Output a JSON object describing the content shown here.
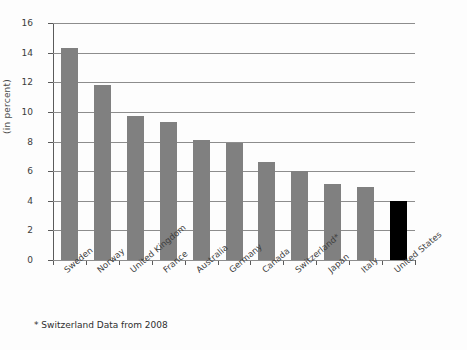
{
  "chart_data": {
    "type": "bar",
    "title": "",
    "xlabel": "",
    "ylabel": "(in percent)",
    "ylim": [
      0,
      16
    ],
    "ytick_step": 2,
    "yticks": [
      "16",
      "14",
      "12",
      "10",
      "8",
      "6",
      "4",
      "2",
      "0"
    ],
    "grid": true,
    "legend": null,
    "categories": [
      "Sweden",
      "Norway",
      "United Kingdom",
      "France",
      "Australia",
      "Germany",
      "Canada",
      "Switzerland*",
      "Japan",
      "Italy",
      "United States"
    ],
    "values": [
      14.3,
      11.8,
      9.7,
      9.3,
      8.1,
      7.9,
      6.6,
      6.0,
      5.1,
      4.9,
      4.0
    ],
    "bar_colors": [
      "#808080",
      "#808080",
      "#808080",
      "#808080",
      "#808080",
      "#808080",
      "#808080",
      "#808080",
      "#808080",
      "#808080",
      "#000000"
    ],
    "annotations": [
      "* Switzerland Data from 2008"
    ]
  },
  "footnote": "* Switzerland Data from 2008",
  "colors": {
    "bar_default": "#808080",
    "bar_highlight": "#000000",
    "gridline": "#8d8d8d",
    "axis": "#5a5a5a",
    "background": "#fdfdfd"
  }
}
